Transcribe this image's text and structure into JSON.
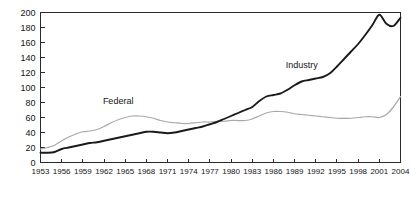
{
  "chart_data": {
    "type": "line",
    "title": "",
    "subtitle": "",
    "xlabel": "",
    "ylabel": "",
    "xlim": [
      1953,
      2004
    ],
    "ylim": [
      0,
      200
    ],
    "grid": false,
    "legend_position": "inline-annotation",
    "yticks": [
      0,
      20,
      40,
      60,
      80,
      100,
      120,
      140,
      160,
      180,
      200
    ],
    "ytick_labels": [
      "0",
      "20",
      "40",
      "60",
      "80",
      "100",
      "120",
      "140",
      "160",
      "180",
      "200"
    ],
    "xticks": [
      1953,
      1956,
      1959,
      1962,
      1965,
      1968,
      1971,
      1974,
      1977,
      1980,
      1983,
      1986,
      1989,
      1992,
      1995,
      1998,
      2001,
      2004
    ],
    "xtick_labels": [
      "1953",
      "1956",
      "1959",
      "1962",
      "1965",
      "1968",
      "1971",
      "1974",
      "1977",
      "1980",
      "1983",
      "1986",
      "1989",
      "1992",
      "1995",
      "1998",
      "2001",
      "2004"
    ],
    "x": [
      1953,
      1954,
      1955,
      1956,
      1957,
      1958,
      1959,
      1960,
      1961,
      1962,
      1963,
      1964,
      1965,
      1966,
      1967,
      1968,
      1969,
      1970,
      1971,
      1972,
      1973,
      1974,
      1975,
      1976,
      1977,
      1978,
      1979,
      1980,
      1981,
      1982,
      1983,
      1984,
      1985,
      1986,
      1987,
      1988,
      1989,
      1990,
      1991,
      1992,
      1993,
      1994,
      1995,
      1996,
      1997,
      1998,
      1999,
      2000,
      2001,
      2002,
      2003,
      2004
    ],
    "series": [
      {
        "name": "Federal",
        "color": "#a9a9a9",
        "label_text": "Federal",
        "values": [
          18,
          20,
          23,
          29,
          34,
          38,
          41,
          42,
          44,
          48,
          53,
          57,
          60,
          62,
          62,
          61,
          59,
          56,
          54,
          53,
          52,
          52,
          53,
          54,
          54,
          55,
          55,
          56,
          56,
          56,
          58,
          62,
          66,
          68,
          68,
          67,
          65,
          64,
          63,
          62,
          61,
          60,
          59,
          59,
          59,
          60,
          61,
          61,
          60,
          64,
          74,
          88
        ]
      },
      {
        "name": "Industry",
        "color": "#1a1a1a",
        "label_text": "Industry",
        "values": [
          13,
          13,
          14,
          18,
          20,
          22,
          24,
          26,
          27,
          29,
          31,
          33,
          35,
          37,
          39,
          41,
          41,
          40,
          39,
          40,
          42,
          44,
          46,
          48,
          51,
          54,
          58,
          62,
          66,
          70,
          74,
          82,
          88,
          90,
          92,
          97,
          103,
          108,
          110,
          112,
          114,
          119,
          128,
          138,
          148,
          158,
          170,
          183,
          197,
          185,
          182,
          193
        ]
      }
    ],
    "annotations": [
      {
        "text": "Federal",
        "x": 1964,
        "y": 78
      },
      {
        "text": "Industry",
        "x": 1990,
        "y": 126
      }
    ]
  }
}
